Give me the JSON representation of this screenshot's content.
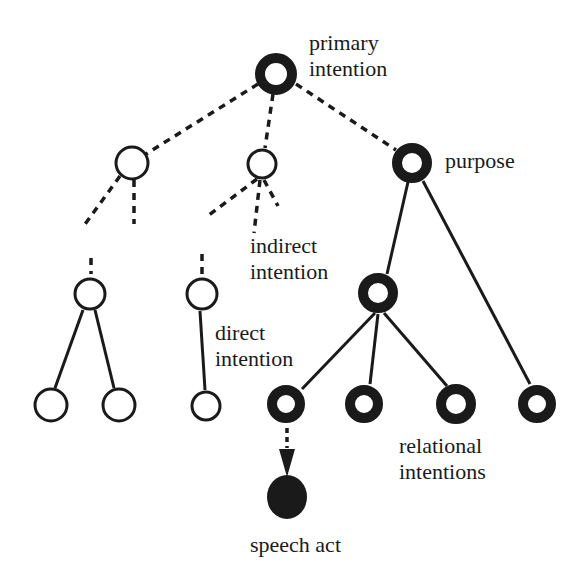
{
  "labels": {
    "primary_line1": "primary",
    "primary_line2": "intention",
    "purpose": "purpose",
    "indirect_line1": "indirect",
    "indirect_line2": "intention",
    "direct_line1": "direct",
    "direct_line2": "intention",
    "relational_line1": "relational",
    "relational_line2": "intentions",
    "speech_act": "speech act"
  },
  "colors": {
    "ink": "#1a1a1a",
    "background": "#ffffff"
  },
  "nodes": [
    {
      "id": "primary-intention",
      "type": "thick-ring"
    },
    {
      "id": "left-open",
      "type": "open"
    },
    {
      "id": "middle-open",
      "type": "open"
    },
    {
      "id": "purpose",
      "type": "thick-ring"
    },
    {
      "id": "subtree-a-root",
      "type": "open"
    },
    {
      "id": "subtree-b-root",
      "type": "open"
    },
    {
      "id": "leaf-a1",
      "type": "open"
    },
    {
      "id": "leaf-a2",
      "type": "open"
    },
    {
      "id": "leaf-b1",
      "type": "open"
    },
    {
      "id": "relational-root",
      "type": "thick-ring"
    },
    {
      "id": "relational-1",
      "type": "thick-ring"
    },
    {
      "id": "relational-2",
      "type": "thick-ring"
    },
    {
      "id": "relational-3",
      "type": "thick-ring"
    },
    {
      "id": "relational-4",
      "type": "thick-ring"
    },
    {
      "id": "speech-act",
      "type": "filled"
    }
  ]
}
